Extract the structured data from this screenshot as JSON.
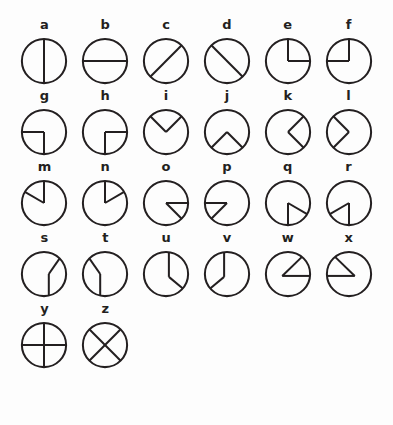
{
  "figure": {
    "background_color": "#fdfdfd",
    "stroke_color": "#231f20",
    "label_color": "#231f20",
    "columns": 6,
    "rows": 5,
    "circle_radius": 23,
    "stroke_width": 2.1
  },
  "symbols": [
    {
      "label": "a",
      "name": "vertical-diameter",
      "description": "circle divided by a vertical diameter",
      "segments": [
        [
          0,
          -23,
          0,
          23
        ]
      ]
    },
    {
      "label": "b",
      "name": "horizontal-diameter",
      "description": "circle divided by a horizontal diameter",
      "segments": [
        [
          -23,
          0,
          23,
          0
        ]
      ]
    },
    {
      "label": "c",
      "name": "diagonal-diameter-up-right",
      "description": "circle divided by a diagonal from lower-left to upper-right",
      "segments": [
        [
          -16.3,
          16.3,
          16.3,
          -16.3
        ]
      ]
    },
    {
      "label": "d",
      "name": "diagonal-diameter-down-right",
      "description": "circle divided by a diagonal from upper-left to lower-right",
      "segments": [
        [
          -16.3,
          -16.3,
          16.3,
          16.3
        ]
      ]
    },
    {
      "label": "e",
      "name": "right-angle-lower-right",
      "description": "vertical radius up and horizontal radius right meeting at centre",
      "segments": [
        [
          0,
          -23,
          0,
          0
        ],
        [
          0,
          0,
          23,
          0
        ]
      ]
    },
    {
      "label": "f",
      "name": "right-angle-upper-left",
      "description": "vertical radius up and horizontal radius left meeting at centre",
      "segments": [
        [
          0,
          -23,
          0,
          0
        ],
        [
          0,
          0,
          -23,
          0
        ]
      ]
    },
    {
      "label": "g",
      "name": "right-angle-lower-left",
      "description": "horizontal radius left and vertical radius down meeting at centre",
      "segments": [
        [
          -23,
          0,
          0,
          0
        ],
        [
          0,
          0,
          0,
          23
        ]
      ]
    },
    {
      "label": "h",
      "name": "right-angle-lower-right-down",
      "description": "horizontal radius right and vertical radius down meeting at centre",
      "segments": [
        [
          23,
          0,
          0,
          0
        ],
        [
          0,
          0,
          0,
          23
        ]
      ]
    },
    {
      "label": "i",
      "name": "vee-open-up",
      "description": "V shape with vertex at centre opening upward",
      "segments": [
        [
          -16.3,
          -16.3,
          0,
          0
        ],
        [
          0,
          0,
          16.3,
          -16.3
        ]
      ]
    },
    {
      "label": "j",
      "name": "vee-open-down",
      "description": "inverted V with vertex at centre opening downward",
      "segments": [
        [
          -16.3,
          16.3,
          0,
          0
        ],
        [
          0,
          0,
          16.3,
          16.3
        ]
      ]
    },
    {
      "label": "k",
      "name": "vee-open-right",
      "description": "angle bracket pointing left, opening to the right",
      "segments": [
        [
          16.3,
          -16.3,
          0,
          0
        ],
        [
          0,
          0,
          16.3,
          16.3
        ]
      ]
    },
    {
      "label": "l",
      "name": "vee-open-left",
      "description": "angle bracket pointing right, opening to the left",
      "segments": [
        [
          -16.3,
          -16.3,
          0,
          0
        ],
        [
          0,
          0,
          -16.3,
          16.3
        ]
      ]
    },
    {
      "label": "m",
      "name": "narrow-wedge-up-left",
      "description": "narrow wedge at centre between 12 o'clock and upper-left",
      "segments": [
        [
          0,
          -23,
          0,
          0
        ],
        [
          0,
          0,
          -19.9,
          -11.5
        ]
      ]
    },
    {
      "label": "n",
      "name": "narrow-wedge-up-right",
      "description": "narrow wedge at centre between 12 o'clock and upper-right",
      "segments": [
        [
          0,
          -23,
          0,
          0
        ],
        [
          0,
          0,
          19.9,
          -11.5
        ]
      ]
    },
    {
      "label": "o",
      "name": "narrow-wedge-right-down",
      "description": "narrow wedge at centre between 3 o'clock and lower-right",
      "segments": [
        [
          23,
          0,
          0,
          0
        ],
        [
          0,
          0,
          16.3,
          16.3
        ]
      ]
    },
    {
      "label": "p",
      "name": "narrow-wedge-left-down",
      "description": "narrow wedge at centre between 9 o'clock and lower-left",
      "segments": [
        [
          -23,
          0,
          0,
          0
        ],
        [
          0,
          0,
          -16.3,
          16.3
        ]
      ]
    },
    {
      "label": "q",
      "name": "narrow-wedge-down-right",
      "description": "narrow wedge at centre between 6 o'clock and lower-right",
      "segments": [
        [
          0,
          23,
          0,
          0
        ],
        [
          0,
          0,
          19.9,
          11.5
        ]
      ]
    },
    {
      "label": "r",
      "name": "narrow-wedge-down-left",
      "description": "narrow wedge at centre between 6 o'clock and lower-left",
      "segments": [
        [
          0,
          23,
          0,
          0
        ],
        [
          0,
          0,
          -19.9,
          11.5
        ]
      ]
    },
    {
      "label": "s",
      "name": "bent-line-upper-right-to-bottom",
      "description": "bent line from upper-right rim to bottom rim with elbow right of centre",
      "segments": [
        [
          16.3,
          -16.3,
          5,
          0
        ],
        [
          5,
          0,
          5,
          22.5
        ]
      ]
    },
    {
      "label": "t",
      "name": "bent-line-upper-left-to-bottom",
      "description": "bent line from upper-left rim to bottom rim with elbow left of centre",
      "segments": [
        [
          -16.3,
          -16.3,
          -5,
          0
        ],
        [
          -5,
          0,
          -5,
          22.5
        ]
      ]
    },
    {
      "label": "u",
      "name": "bent-line-top-to-lower-right",
      "description": "bent line from top rim down then out to lower-right rim",
      "segments": [
        [
          3,
          -22.8,
          3,
          3
        ],
        [
          3,
          3,
          17.5,
          15
        ]
      ]
    },
    {
      "label": "v",
      "name": "bent-line-top-to-lower-left",
      "description": "bent line from top rim down then out to lower-left rim",
      "segments": [
        [
          -3,
          -22.8,
          -3,
          3
        ],
        [
          -3,
          3,
          -17.5,
          15
        ]
      ]
    },
    {
      "label": "w",
      "name": "narrow-wedge-right-up-offset-left",
      "description": "narrow wedge with vertex left of centre opening to the right and upper-right",
      "segments": [
        [
          -6,
          2,
          23,
          2
        ],
        [
          -6,
          2,
          14.5,
          -17.8
        ]
      ]
    },
    {
      "label": "x",
      "name": "narrow-wedge-left-up-offset-right",
      "description": "narrow wedge with vertex right of centre opening to the left and upper-left",
      "segments": [
        [
          6,
          2,
          -23,
          2
        ],
        [
          6,
          2,
          -14.5,
          -17.8
        ]
      ]
    },
    {
      "label": "y",
      "name": "cross-plus",
      "description": "circle with vertical and horizontal diameters forming a plus",
      "segments": [
        [
          0,
          -23,
          0,
          23
        ],
        [
          -23,
          0,
          23,
          0
        ]
      ]
    },
    {
      "label": "z",
      "name": "cross-diagonal",
      "description": "circle with both diagonals forming an X",
      "segments": [
        [
          -16.3,
          -16.3,
          16.3,
          16.3
        ],
        [
          16.3,
          -16.3,
          -16.3,
          16.3
        ]
      ]
    }
  ]
}
